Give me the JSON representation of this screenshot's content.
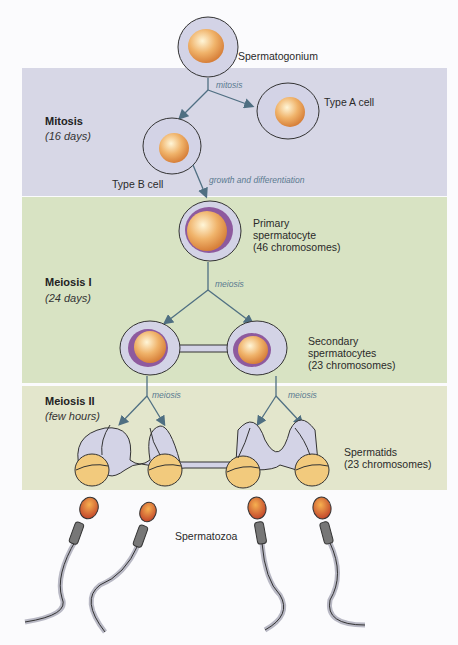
{
  "stages": [
    {
      "name": "Mitosis",
      "duration": "(16 days)"
    },
    {
      "name": "Meiosis I",
      "duration": "(24 days)"
    },
    {
      "name": "Meiosis II",
      "duration": "(few hours)"
    }
  ],
  "cells": {
    "spermatogonium": "Spermatogonium",
    "type_a": "Type A cell",
    "type_b": "Type B cell",
    "primary": [
      "Primary",
      "spermatocyte",
      "(46 chromosomes)"
    ],
    "secondary": [
      "Secondary",
      "spermatocytes",
      "(23 chromosomes)"
    ],
    "spermatids": [
      "Spermatids",
      "(23 chromosomes)"
    ],
    "spermatozoa": "Spermatozoa"
  },
  "processes": {
    "mitosis": "mitosis",
    "growth": "growth and differentiation",
    "meiosis1": "meiosis",
    "meiosis2_left": "meiosis",
    "meiosis2_right": "meiosis"
  },
  "colors": {
    "mitosis_band": "#d7d7e6",
    "meiosis1_band": "#d8e3c3",
    "meiosis2_band": "#e3e6cc",
    "cytoplasm": "#d3d3e6",
    "nucleus": "#e9a35a",
    "nuclear_ring": "#8e5a9e",
    "arrow": "#4f6f82"
  }
}
